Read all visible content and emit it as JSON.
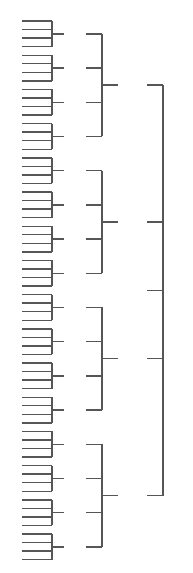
{
  "figure": {
    "type": "dendrogram",
    "orientation": "left-to-right",
    "background_color": "#ffffff",
    "line_color": "#565656",
    "line_width": 1.4,
    "width": 193,
    "height": 573
  },
  "chart_data": {
    "type": "tree",
    "subtitle": "",
    "xlabel": "",
    "ylabel": "",
    "legend": [],
    "grid": false,
    "axis_visible": false,
    "tick_labels": [],
    "orientation": "left-to-right",
    "branching_factor": 4,
    "depth": 4,
    "leaf_count": 64,
    "node_counts_by_level": [
      64,
      16,
      4,
      1
    ],
    "levels": [
      {
        "level": 0,
        "name": "leaves",
        "count": 64,
        "x_start": 22,
        "x_end": 52,
        "spacing": 8.55,
        "first_y": 21.0
      },
      {
        "level": 1,
        "name": "leaf-cluster-node",
        "count": 16,
        "x_bar": 52,
        "x_stem_end": 64,
        "spacing": 34.2
      },
      {
        "level": 2,
        "name": "mid-node",
        "count": 4,
        "x_bar": 102,
        "x_stem_end": 118,
        "spacing": 136.8
      },
      {
        "level": 3,
        "name": "root-node",
        "count": 1,
        "x_bar": 163,
        "x_stem_end": 147,
        "spacing": 0
      }
    ],
    "geometry": {
      "leaf_x_left": 22,
      "leaf_x_right": 52,
      "leaf_top_y": 21.0,
      "leaf_step_y": 8.55,
      "cluster_bar_x": 52,
      "cluster_stem_x": 64,
      "mid_bar_x": 102,
      "mid_inlet_x": 86,
      "mid_stem_x": 118,
      "root_bar_x": 163,
      "root_inlet_x": 147,
      "root_stem_x": 147
    }
  }
}
